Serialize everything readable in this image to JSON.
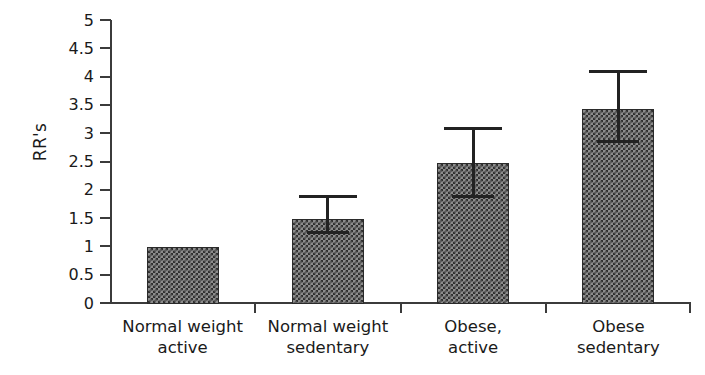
{
  "chart_data": {
    "type": "bar",
    "title": "",
    "xlabel": "",
    "ylabel": "RR's",
    "ylim": [
      0,
      5
    ],
    "ytick_step": 0.5,
    "grid": false,
    "legend": null,
    "categories": [
      "Normal weight\nactive",
      "Normal weight\nsedentary",
      "Obese,\nactive",
      "Obese\nsedentary"
    ],
    "ytick_labels": [
      "5",
      "4.5",
      "4",
      "3.5",
      "3",
      "2.5",
      "2",
      "1.5",
      "1",
      "0.5",
      "0"
    ],
    "ytick_values": [
      5,
      4.5,
      4,
      3.5,
      3,
      2.5,
      2,
      1.5,
      1,
      0.5,
      0
    ],
    "values": [
      1.0,
      1.5,
      2.5,
      3.45
    ],
    "error_low": [
      null,
      1.27,
      1.9,
      2.88
    ],
    "error_high": [
      null,
      1.9,
      3.1,
      4.1
    ],
    "series": [
      {
        "name": "RR's",
        "values": [
          1.0,
          1.5,
          2.5,
          3.45
        ]
      }
    ],
    "bar_fill": "#8c8c8c",
    "bar_pattern": "checkerboard",
    "bar_border": "#2b2b2b",
    "axis_color": "#3b3b3b"
  }
}
